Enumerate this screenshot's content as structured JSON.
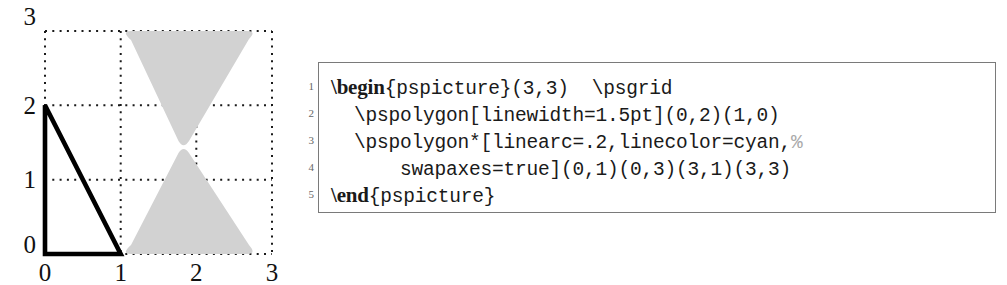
{
  "figure": {
    "name": "pspicture-example",
    "grid": {
      "x_ticks": [
        "0",
        "1",
        "2",
        "3"
      ],
      "y_ticks": [
        "0",
        "1",
        "2",
        "3"
      ],
      "xlim": [
        0,
        3
      ],
      "ylim": [
        0,
        3
      ],
      "style": "dotted",
      "dot_color": "#1a1a1a"
    },
    "shapes": {
      "triangle": {
        "name": "pspolygon-triangle",
        "points": "(0,0)(0,2)(1,0)",
        "linewidth": "1.5pt",
        "stroke": "#000000",
        "fill": "none"
      },
      "bowtie": {
        "name": "pspolygon-bowtie",
        "points": "(1,0)(1,3)(3,0)(3,3)",
        "linearc": ".2",
        "linecolor": "cyan",
        "fill": "#d2d2d2"
      }
    }
  },
  "code": {
    "line_numbers": [
      "1",
      "2",
      "3",
      "4",
      "5"
    ],
    "lines": [
      {
        "keyword": "\\begin",
        "rest": "{pspicture}(3,3)  \\psgrid",
        "comment": ""
      },
      {
        "keyword": "",
        "rest": "  \\pspolygon[linewidth=1.5pt](0,2)(1,0)",
        "comment": ""
      },
      {
        "keyword": "",
        "rest": "  \\pspolygon*[linearc=.2,linecolor=cyan,",
        "comment": "%"
      },
      {
        "keyword": "",
        "rest": "      swapaxes=true](0,1)(0,3)(3,1)(3,3)",
        "comment": ""
      },
      {
        "keyword": "\\end",
        "rest": "{pspicture}",
        "comment": ""
      }
    ]
  },
  "colors": {
    "border": "#7a7a7a",
    "fill_gray": "#d2d2d2",
    "comment_gray": "#a9a9a9",
    "ink": "#1a1a1a"
  }
}
